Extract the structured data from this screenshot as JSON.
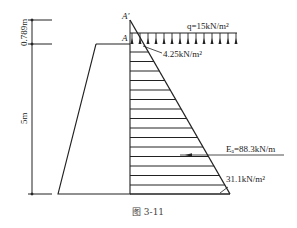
{
  "diagram": {
    "caption": "图 3-11",
    "labels": {
      "point_a_prime": "A′",
      "point_a": "A",
      "surcharge": "q=15kN/m²",
      "top_pressure": "4.25kN/m²",
      "bottom_pressure": "31.1kN/m²",
      "resultant": "Eₐ=88.3kN/m"
    },
    "dimensions": {
      "upper": "0.789m",
      "lower": "5m"
    },
    "values": {
      "surcharge_q_kN_m2": 15,
      "top_pressure_kN_m2": 4.25,
      "bottom_pressure_kN_m2": 31.1,
      "resultant_Ea_kN_m": 88.3,
      "equivalent_height_m": 0.789,
      "wall_height_m": 5
    },
    "colors": {
      "line": "#222222",
      "text": "#222222",
      "background": "#ffffff"
    }
  }
}
